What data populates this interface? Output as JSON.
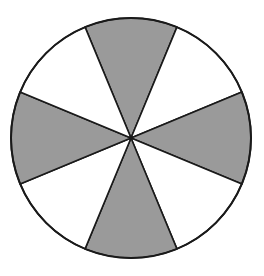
{
  "diagram": {
    "type": "circle-sectors",
    "total_sectors": 8,
    "shaded_sectors": 4,
    "shaded_positions": [
      "top",
      "right",
      "bottom",
      "left"
    ],
    "center": [
      131,
      138
    ],
    "radius": 120,
    "colors": {
      "shaded": "#9a9a9a",
      "unshaded": "#ffffff",
      "stroke": "#1a1a1a",
      "background": "#ffffff"
    }
  }
}
